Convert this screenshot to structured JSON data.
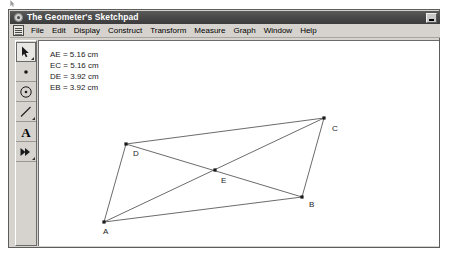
{
  "window": {
    "title": "The Geometer's Sketchpad",
    "app_icon": "sketchpad-icon",
    "minimize_label": "",
    "minimize_icon": "minimize-icon"
  },
  "menu": {
    "doc_icon": "document-icon",
    "items": [
      {
        "label": "File"
      },
      {
        "label": "Edit"
      },
      {
        "label": "Display"
      },
      {
        "label": "Construct"
      },
      {
        "label": "Transform"
      },
      {
        "label": "Measure"
      },
      {
        "label": "Graph"
      },
      {
        "label": "Window"
      },
      {
        "label": "Help"
      }
    ]
  },
  "toolbox": {
    "tools": [
      {
        "name": "selection-arrow-tool",
        "icon": "arrow-icon",
        "selected": true
      },
      {
        "name": "point-tool",
        "icon": "point-icon",
        "selected": false
      },
      {
        "name": "compass-circle-tool",
        "icon": "circle-icon",
        "selected": false
      },
      {
        "name": "straightedge-segment-tool",
        "icon": "segment-icon",
        "selected": false
      },
      {
        "name": "text-tool",
        "icon": "letter-a-icon",
        "selected": false
      },
      {
        "name": "custom-transform-tool",
        "icon": "double-arrow-icon",
        "selected": false
      }
    ]
  },
  "measurements": [
    "AE = 5.16 cm",
    "EC = 5.16 cm",
    "DE = 3.92 cm",
    "EB = 3.92 cm"
  ],
  "sketch": {
    "points": [
      {
        "label": "A",
        "x": 65,
        "y": 181,
        "lx": 64,
        "ly": 193
      },
      {
        "label": "B",
        "x": 263,
        "y": 156,
        "lx": 270,
        "ly": 166
      },
      {
        "label": "C",
        "x": 285,
        "y": 77,
        "lx": 293,
        "ly": 90
      },
      {
        "label": "D",
        "x": 87,
        "y": 103,
        "lx": 94,
        "ly": 115
      },
      {
        "label": "E",
        "x": 176,
        "y": 129,
        "lx": 182,
        "ly": 142
      }
    ],
    "segments": [
      {
        "name": "segment-A-D",
        "from": "A",
        "to": "D"
      },
      {
        "name": "segment-D-C",
        "from": "D",
        "to": "C"
      },
      {
        "name": "segment-C-B",
        "from": "C",
        "to": "B"
      },
      {
        "name": "segment-B-A",
        "from": "B",
        "to": "A"
      },
      {
        "name": "diagonal-A-C",
        "from": "A",
        "to": "C"
      },
      {
        "name": "diagonal-D-B",
        "from": "D",
        "to": "B"
      }
    ],
    "stroke_color": "#5a5a5a",
    "point_color": "#1a1a1a"
  }
}
